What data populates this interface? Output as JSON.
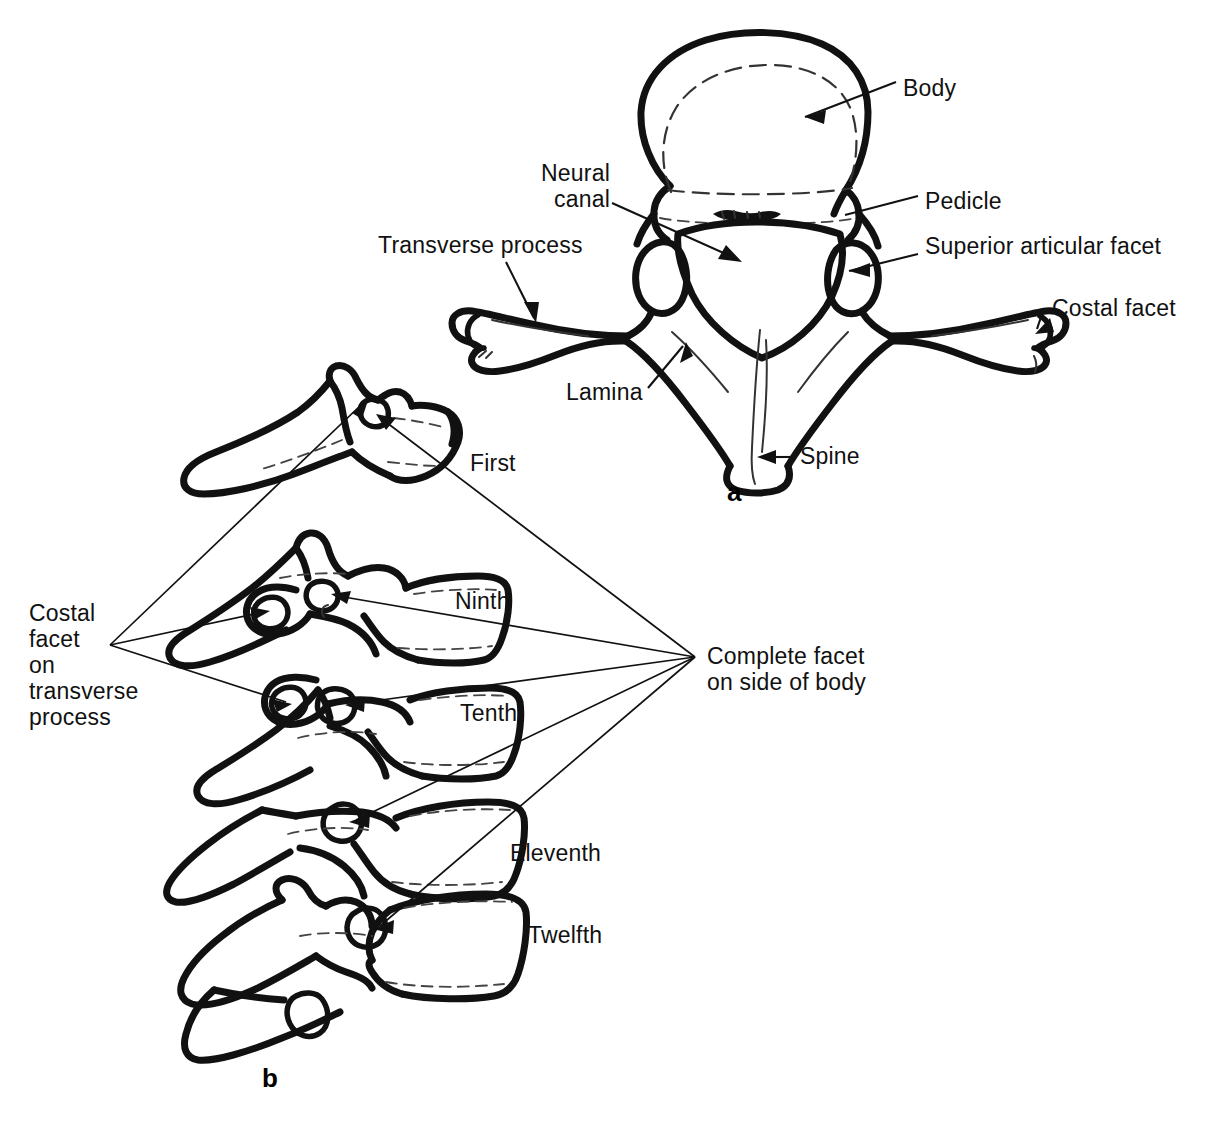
{
  "figure": {
    "panels": [
      {
        "letter": "a",
        "caption": "a",
        "description": "Superior view of a typical thoracic vertebra"
      },
      {
        "letter": "b",
        "caption": "b",
        "description": "Lateral view of first, ninth, tenth, eleventh and twelfth thoracic vertebrae"
      }
    ]
  },
  "panel_a": {
    "letter": "a",
    "labels": {
      "body": "Body",
      "pedicle": "Pedicle",
      "superior_articular_facet": "Superior articular facet",
      "costal_facet": "Costal facet",
      "neural_canal": "Neural\ncanal",
      "transverse_process": "Transverse process",
      "lamina": "Lamina",
      "spine": "Spine"
    }
  },
  "panel_b": {
    "letter": "b",
    "vertebra_labels": {
      "first": "First",
      "ninth": "Ninth",
      "tenth": "Tenth",
      "eleventh": "Eleventh",
      "twelfth": "Twelfth"
    },
    "labels": {
      "costal_facet_on_transverse_process": "Costal\nfacet\non\ntransverse\nprocess",
      "complete_facet_on_side_of_body": "Complete facet\non side of body"
    }
  },
  "colors": {
    "background": "#ffffff",
    "ink": "#111111",
    "inner_detail": "#333333"
  }
}
